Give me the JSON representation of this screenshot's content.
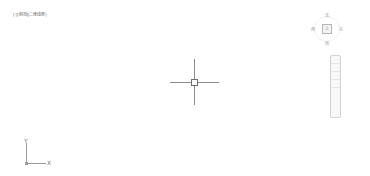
{
  "viewport": {
    "controls": {
      "minus": "[-]",
      "view": "[俯视]",
      "visual_style": "[二维线框]"
    }
  },
  "viewcube": {
    "face_label": "上",
    "north": "北",
    "south": "南",
    "west": "西",
    "east": "东"
  },
  "ucs": {
    "x_label": "X",
    "y_label": "Y"
  },
  "colors": {
    "background": "#ffffff",
    "crosshair": "#8c8c8c",
    "ucs": "#9a9a9a"
  }
}
